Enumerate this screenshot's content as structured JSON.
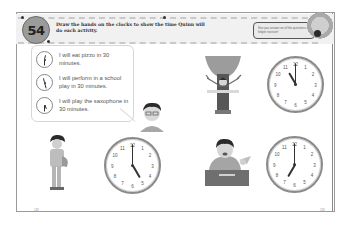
{
  "header": {
    "activity_number": "54",
    "instructions": "Draw the hands on the clocks to show the time Quinn will do each activity.",
    "tip_text": "See you answer on of the questions on helper receiver!"
  },
  "speech_bubble": {
    "items": [
      {
        "label": "I will eat pizzo in 30 minutes.",
        "clock": {
          "hour_deg": 15,
          "minute_deg": 180
        }
      },
      {
        "label": "I will perform in a school play in 30 minutes.",
        "clock": {
          "hour_deg": 345,
          "minute_deg": 165
        }
      },
      {
        "label": "I will play the saxophone in 30 minutes.",
        "clock": {
          "hour_deg": 150,
          "minute_deg": 180
        }
      }
    ]
  },
  "activities": [
    {
      "name": "tree-costume-child",
      "clock": {
        "time": "11:00",
        "hour_deg": 330,
        "minute_deg": 0
      }
    },
    {
      "name": "saxophone-child",
      "clock": {
        "time": "5:00",
        "hour_deg": 150,
        "minute_deg": 0
      }
    },
    {
      "name": "pizza-eating-child",
      "clock": {
        "time": "7:00",
        "hour_deg": 210,
        "minute_deg": 0
      }
    }
  ],
  "clock_numbers": [
    "12",
    "1",
    "2",
    "3",
    "4",
    "5",
    "6",
    "7",
    "8",
    "9",
    "10",
    "11"
  ],
  "footer": {
    "left_page_number": "118",
    "right_page_number": "119"
  },
  "colors": {
    "badge": "#9b9b9b",
    "header_band": "#f1f1f1",
    "border": "#9a9a9a"
  }
}
